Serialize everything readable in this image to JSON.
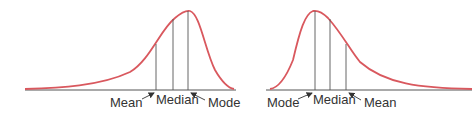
{
  "colors": {
    "curve": "#d9585e",
    "axis": "#555555",
    "text": "#333333"
  },
  "left_panel": {
    "skew": "negative (left-skewed)",
    "labels": {
      "mean": "Mean",
      "median": "Median",
      "mode": "Mode"
    }
  },
  "right_panel": {
    "skew": "positive (right-skewed)",
    "labels": {
      "mode": "Mode",
      "median": "Median",
      "mean": "Mean"
    }
  }
}
